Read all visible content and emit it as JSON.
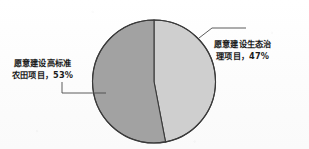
{
  "chart_data": {
    "type": "pie",
    "title": "",
    "categories": [
      "愿意建设生态治理项目",
      "愿意建设高标准农田项目"
    ],
    "values": [
      47,
      53
    ],
    "value_unit": "%",
    "legend_position": "callout-labels",
    "grid": false,
    "slices": [
      {
        "name": "愿意建设生态治理项目",
        "value": 47,
        "value_text": "47%",
        "color": "#cfcfcf",
        "label_lines": [
          "愿意建设生态治",
          "理项目，47%"
        ],
        "side": "right"
      },
      {
        "name": "愿意建设高标准农田项目",
        "value": 53,
        "value_text": "53%",
        "color": "#a2a2a2",
        "label_lines": [
          "愿意建设高标准",
          "农田项目，53%"
        ],
        "side": "left"
      }
    ]
  },
  "labels": {
    "eco": {
      "line1": "愿意建设生态治",
      "line2": "理项目，47%"
    },
    "farm": {
      "line1": "愿意建设高标准",
      "line2": "农田项目，53%"
    }
  },
  "colors": {
    "slice_eco": "#cfcfcf",
    "slice_farm": "#a2a2a2",
    "outline": "#3a3a3a",
    "leader_line": "#4a4a4a",
    "background": "#fdfdfd",
    "text": "#1b1b1b"
  }
}
